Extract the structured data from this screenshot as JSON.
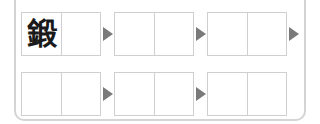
{
  "worksheet": {
    "rows": [
      {
        "boxes": [
          {
            "cells": [
              "鍛",
              ""
            ]
          },
          {
            "cells": [
              "",
              ""
            ]
          },
          {
            "cells": [
              "",
              ""
            ]
          }
        ],
        "trailing_arrow": true
      },
      {
        "boxes": [
          {
            "cells": [
              "",
              ""
            ]
          },
          {
            "cells": [
              "",
              ""
            ]
          },
          {
            "cells": [
              "",
              ""
            ]
          }
        ],
        "trailing_arrow": false
      }
    ],
    "colors": {
      "border": "#cfcfcf",
      "frame": "#d4d4d4",
      "arrow": "#7a7a7a",
      "text": "#1a1a1a"
    }
  }
}
